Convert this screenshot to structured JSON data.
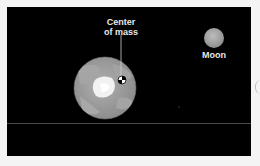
{
  "diagram": {
    "labels": {
      "center_of_mass": "Center\nof mass",
      "center_of_mass_line1": "Center",
      "center_of_mass_line2": "of mass",
      "moon": "Moon"
    },
    "colors": {
      "background": "#000000",
      "earth": "#9a9a9a",
      "earth_land": "#b3b3b3",
      "earth_ice": "#f2f2f2",
      "moon": "#a8a8a8",
      "text": "#e8e8e8"
    }
  }
}
